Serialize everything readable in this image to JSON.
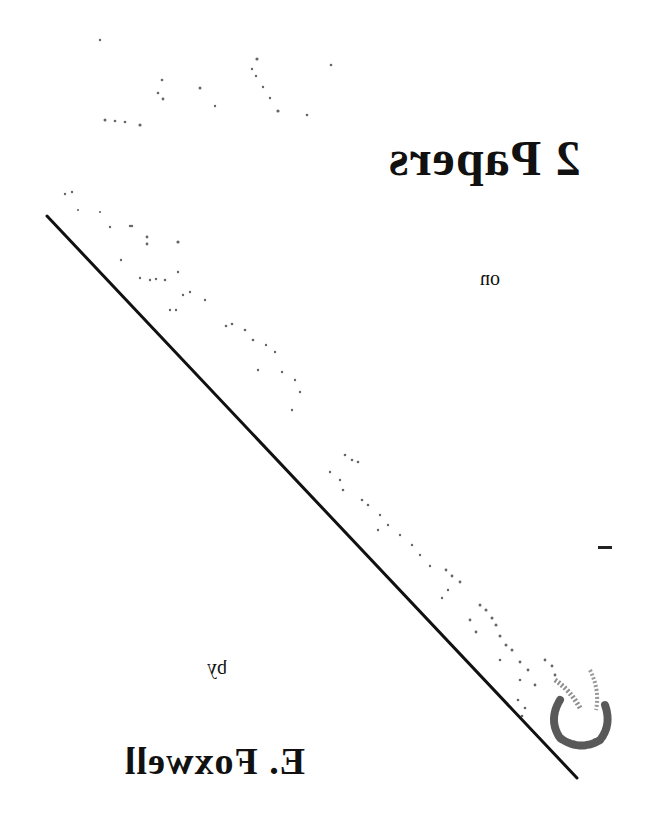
{
  "document": {
    "orientation": "mirrored-horizontal",
    "title": "2 Papers",
    "connector_word": "on",
    "byline_word": "by",
    "author": "E. Foxwell",
    "stamp": {
      "description": "faint diagonal speckled stamp text (illegible)",
      "legible_text": ""
    },
    "colors": {
      "background": "#ffffff",
      "ink": "#111111"
    }
  }
}
